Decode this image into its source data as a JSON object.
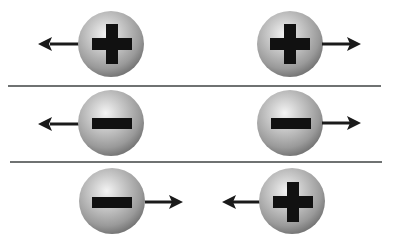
{
  "title": "Like charges repel, opposite charges attract",
  "colors": {
    "sphere_light": "#f2f2f2",
    "sphere_mid": "#b3b3b3",
    "sphere_dark": "#6e6e6e",
    "symbol": "#111111",
    "arrow": "#1a1a1a",
    "divider": "#6f7272"
  },
  "dividers": [
    {
      "y": 85,
      "x1": 8,
      "x2": 381
    },
    {
      "y": 161,
      "x1": 10,
      "x2": 382
    }
  ],
  "rows": [
    {
      "label": "Two positive charges repel",
      "particles": [
        {
          "charge": "positive",
          "symbol": "+",
          "cx": 111,
          "cy": 44,
          "r": 33,
          "arrow": "left"
        },
        {
          "charge": "positive",
          "symbol": "+",
          "cx": 290,
          "cy": 44,
          "r": 33,
          "arrow": "right"
        }
      ]
    },
    {
      "label": "Two negative charges repel",
      "particles": [
        {
          "charge": "negative",
          "symbol": "-",
          "cx": 111,
          "cy": 123,
          "r": 33,
          "arrow": "left"
        },
        {
          "charge": "negative",
          "symbol": "-",
          "cx": 290,
          "cy": 123,
          "r": 33,
          "arrow": "right"
        }
      ]
    },
    {
      "label": "Opposite charges attract",
      "particles": [
        {
          "charge": "negative",
          "symbol": "-",
          "cx": 112,
          "cy": 201,
          "r": 33,
          "arrow": "right"
        },
        {
          "charge": "positive",
          "symbol": "+",
          "cx": 292,
          "cy": 201,
          "r": 33,
          "arrow": "left"
        }
      ]
    }
  ]
}
